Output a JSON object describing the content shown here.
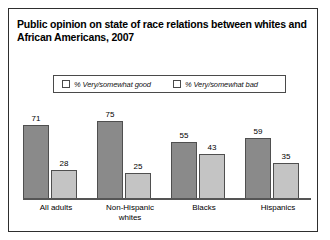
{
  "chart_data": {
    "type": "bar",
    "title": "Public opinion on state of race relations between whites and African Americans, 2007",
    "title_line1": "Public opinion on state of race relations between whites and",
    "title_line2": "African Americans, 2007",
    "xlabel": "",
    "ylabel": "",
    "ylim": [
      0,
      100
    ],
    "grid": false,
    "legend_position": "top-center",
    "categories": [
      "All adults",
      "Non-Hispanic whites",
      "Blacks",
      "Hispanics"
    ],
    "category_lines": [
      [
        "All adults"
      ],
      [
        "Non-Hispanic",
        "whites"
      ],
      [
        "Blacks"
      ],
      [
        "Hispanics"
      ]
    ],
    "series": [
      {
        "name": "% Very/somewhat good",
        "color": "#8a8a8a",
        "values": [
          71,
          75,
          55,
          59
        ]
      },
      {
        "name": "% Very/somewhat bad",
        "color": "#c4c4c4",
        "values": [
          28,
          25,
          43,
          35
        ]
      }
    ]
  },
  "legend": {
    "entries": [
      {
        "label": "% Very/somewhat good",
        "color": "#8a8a8a"
      },
      {
        "label": "% Very/somewhat bad",
        "color": "#c4c4c4"
      }
    ]
  },
  "colors": {
    "good_bar": "#8a8a8a",
    "bad_bar": "#c4c4c4",
    "border": "#2e2e2e",
    "axis": "#555555",
    "text": "#000000"
  }
}
